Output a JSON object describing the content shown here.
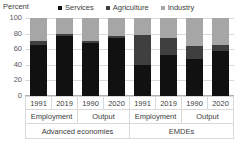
{
  "axis_title": "Percent",
  "legend": [
    {
      "label": "Services",
      "color": "#111111",
      "icon": "legend-square-icon"
    },
    {
      "label": "Agriculture",
      "color": "#3f3f3f",
      "icon": "legend-square-icon"
    },
    {
      "label": "Industry",
      "color": "#a6a6a6",
      "icon": "legend-square-icon"
    }
  ],
  "y_ticks": [
    "100",
    "80",
    "60",
    "40",
    "20",
    "0"
  ],
  "years": [
    "1991",
    "2019",
    "1990",
    "2020",
    "1991",
    "2019",
    "1990",
    "2020"
  ],
  "measures": [
    "Employment",
    "Output",
    "Employment",
    "Output"
  ],
  "groups": [
    "Advanced economies",
    "EMDEs"
  ],
  "chart_data": {
    "type": "bar",
    "subtype": "stacked-column",
    "title": "",
    "subtitle": "",
    "xlabel": "",
    "ylabel": "Percent",
    "ylim": [
      0,
      100
    ],
    "y_ticks": [
      0,
      20,
      40,
      60,
      80,
      100
    ],
    "grid": true,
    "legend_position": "top",
    "stacked_total": 100,
    "categories": [
      "Advanced economies / Employment / 1991",
      "Advanced economies / Employment / 2019",
      "Advanced economies / Output / 1990",
      "Advanced economies / Output / 2020",
      "EMDEs / Employment / 1991",
      "EMDEs / Employment / 2019",
      "EMDEs / Output / 1990",
      "EMDEs / Output / 2020"
    ],
    "tick_labels": [
      "1991",
      "2019",
      "1990",
      "2020",
      "1991",
      "2019",
      "1990",
      "2020"
    ],
    "group_labels": [
      "Advanced economies",
      "EMDEs"
    ],
    "measure_labels": [
      "Employment",
      "Output",
      "Employment",
      "Output"
    ],
    "series": [
      {
        "name": "Services",
        "color": "#111111",
        "values": [
          65,
          77,
          68,
          75,
          40,
          52,
          48,
          58
        ]
      },
      {
        "name": "Agriculture",
        "color": "#3f3f3f",
        "values": [
          5,
          3,
          3,
          2,
          38,
          22,
          16,
          8
        ]
      },
      {
        "name": "Industry",
        "color": "#a6a6a6",
        "values": [
          30,
          20,
          29,
          23,
          22,
          26,
          36,
          34
        ]
      }
    ]
  }
}
